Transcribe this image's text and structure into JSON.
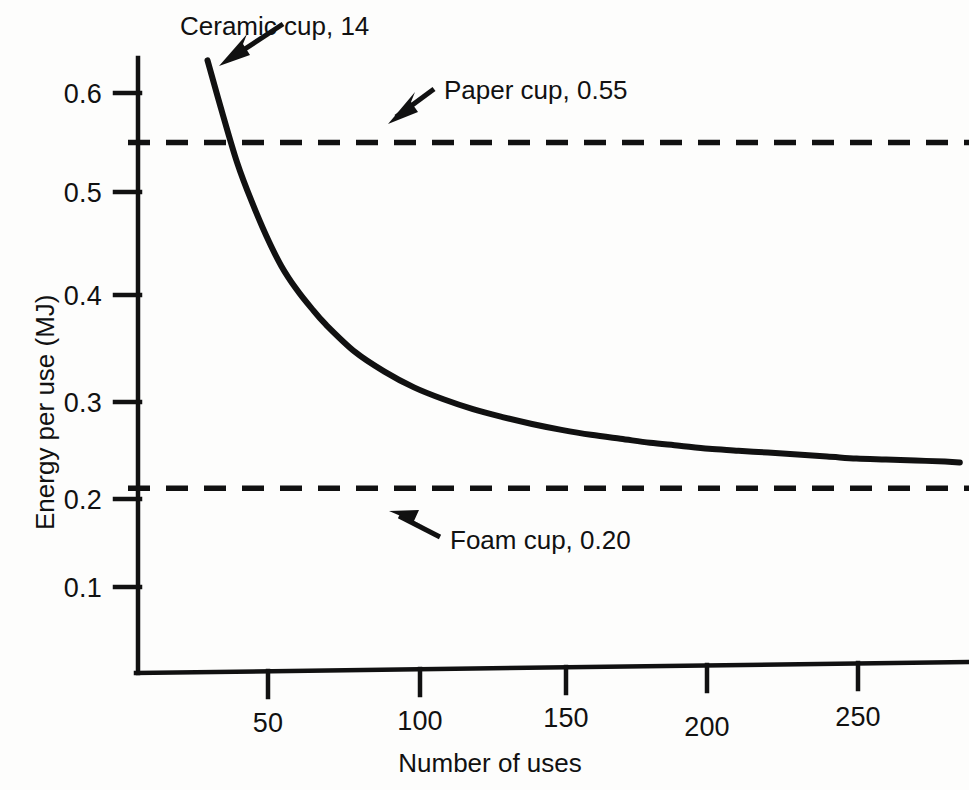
{
  "chart_data": {
    "type": "line",
    "title": "",
    "xlabel": "Number of uses",
    "ylabel": "Energy per use (MJ)",
    "xlim": [
      0,
      285
    ],
    "ylim": [
      0,
      0.645
    ],
    "grid": false,
    "legend": "none",
    "x_ticks": [
      "50",
      "100",
      "150",
      "200",
      "250"
    ],
    "x_tick_values": [
      50,
      100,
      150,
      200,
      250
    ],
    "y_ticks": [
      "0.1",
      "0.2",
      "0.3",
      "0.4",
      "0.5",
      "0.6"
    ],
    "y_tick_values": [
      0.1,
      0.2,
      0.3,
      0.4,
      0.5,
      0.6
    ],
    "series": [
      {
        "name": "Ceramic cup",
        "style": "solid",
        "note": "Energy per use = (14 MJ manufacturing / uses) + 0.18 MJ washing",
        "x": [
          30,
          35,
          40,
          45,
          50,
          55,
          60,
          65,
          70,
          80,
          90,
          100,
          110,
          120,
          130,
          140,
          150,
          160,
          170,
          180,
          190,
          200,
          210,
          220,
          230,
          240,
          250,
          260,
          270,
          280,
          285
        ],
        "y": [
          0.633,
          0.58,
          0.53,
          0.49,
          0.455,
          0.425,
          0.402,
          0.383,
          0.366,
          0.338,
          0.318,
          0.302,
          0.29,
          0.28,
          0.272,
          0.265,
          0.259,
          0.254,
          0.25,
          0.246,
          0.243,
          0.24,
          0.238,
          0.236,
          0.234,
          0.232,
          0.23,
          0.229,
          0.228,
          0.227,
          0.226
        ]
      },
      {
        "name": "Paper cup",
        "style": "dashed",
        "constant_value": 0.55
      },
      {
        "name": "Foam cup",
        "style": "dashed",
        "constant_value": 0.2
      }
    ],
    "annotations": [
      {
        "label": "Ceramic cup, 14",
        "target_series": "Ceramic cup",
        "arrow": "down-left"
      },
      {
        "label": "Paper cup, 0.55",
        "target_series": "Paper cup",
        "arrow": "down-left"
      },
      {
        "label": "Foam cup, 0.20",
        "target_series": "Foam cup",
        "arrow": "up-left"
      }
    ],
    "colors": {
      "curve": "#111111",
      "dashed": "#111111",
      "axis": "#111111",
      "background": "#fdfdfc"
    }
  }
}
